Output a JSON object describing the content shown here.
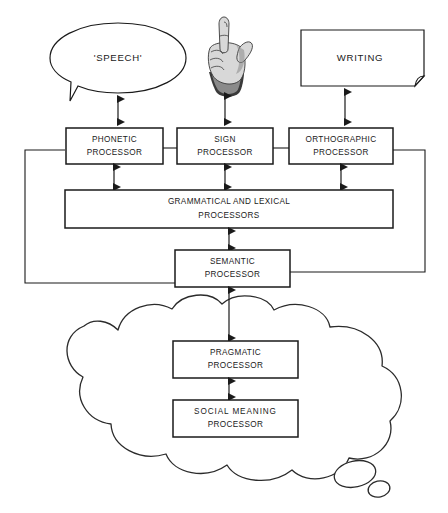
{
  "diagram": {
    "colors": {
      "ink": "#1a1a1a",
      "background": "#ffffff",
      "cloud_stroke": "#2b2b2b"
    },
    "output_modalities": [
      {
        "id": "speech",
        "label": "'SPEECH'",
        "shape": "speech-bubble"
      },
      {
        "id": "sign",
        "label": "",
        "shape": "hand-illustration"
      },
      {
        "id": "writing",
        "label": "WRITING",
        "shape": "page-with-curl"
      }
    ],
    "processors": [
      {
        "id": "phonetic",
        "line1": "PHONETIC",
        "line2": "PROCESSOR"
      },
      {
        "id": "sign",
        "line1": "SIGN",
        "line2": "PROCESSOR"
      },
      {
        "id": "orthographic",
        "line1": "ORTHOGRAPHIC",
        "line2": "PROCESSOR"
      },
      {
        "id": "grammatical",
        "line1": "GRAMMATICAL AND LEXICAL",
        "line2": "PROCESSORS"
      },
      {
        "id": "semantic",
        "line1": "SEMANTIC",
        "line2": "PROCESSOR"
      },
      {
        "id": "pragmatic",
        "line1": "PRAGMATIC",
        "line2": "PROCESSOR"
      },
      {
        "id": "social_meaning",
        "line1": "SOCIAL  MEANING",
        "line2": "PROCESSOR"
      }
    ],
    "connections": [
      {
        "from": "phonetic",
        "to": "speech",
        "style": "double-arrow"
      },
      {
        "from": "sign",
        "to": "sign-hand",
        "style": "double-arrow"
      },
      {
        "from": "orthographic",
        "to": "writing",
        "style": "double-arrow"
      },
      {
        "from": "phonetic",
        "to": "grammatical",
        "style": "double-arrow"
      },
      {
        "from": "sign",
        "to": "grammatical",
        "style": "double-arrow"
      },
      {
        "from": "orthographic",
        "to": "grammatical",
        "style": "double-arrow"
      },
      {
        "from": "grammatical",
        "to": "semantic",
        "style": "double-arrow"
      },
      {
        "from": "semantic",
        "to": "pragmatic",
        "style": "double-arrow"
      },
      {
        "from": "pragmatic",
        "to": "social_meaning",
        "style": "double-arrow"
      },
      {
        "from": "phonetic",
        "to": "semantic",
        "style": "bypass-line-left"
      },
      {
        "from": "orthographic",
        "to": "semantic",
        "style": "bypass-line-right"
      },
      {
        "from": "phonetic",
        "to": "sign",
        "style": "plain-line"
      },
      {
        "from": "sign",
        "to": "orthographic",
        "style": "plain-line"
      }
    ],
    "cloud": {
      "id": "thought-cloud",
      "contains": [
        "pragmatic",
        "social_meaning"
      ],
      "tails": 3
    }
  }
}
